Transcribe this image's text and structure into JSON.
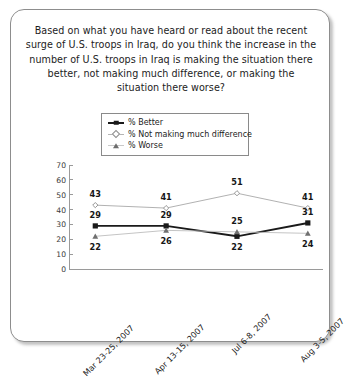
{
  "card": {
    "question": "Based on what you have heard or read about the recent surge of U.S. troops in Iraq, do you think the increase in the number of U.S. troops in Iraq is making the situation there better, not making much difference, or making the situation there worse?"
  },
  "legend": {
    "position": "top-center",
    "items": [
      {
        "label": "% Better",
        "marker": "square-marker",
        "color": "#1a1a1a"
      },
      {
        "label": "% Not making much difference",
        "marker": "diamond-marker",
        "color": "#8c8c8c"
      },
      {
        "label": "% Worse",
        "marker": "triangle-marker",
        "color": "#6d6d6d"
      }
    ]
  },
  "chart_data": {
    "type": "line",
    "title": "",
    "xlabel": "",
    "ylabel": "",
    "ylim": [
      0,
      70
    ],
    "yticks": [
      0,
      10,
      20,
      30,
      40,
      50,
      60,
      70
    ],
    "grid": false,
    "legend_position": "top-center",
    "categories": [
      "Mar 23-25, 2007",
      "Apr 13-15, 2007",
      "Jul 6-8, 2007",
      "Aug 3-5, 2007"
    ],
    "series": [
      {
        "name": "% Better",
        "values": [
          29,
          29,
          22,
          31
        ],
        "marker": "square",
        "color": "#1a1a1a"
      },
      {
        "name": "% Not making much difference",
        "values": [
          43,
          41,
          51,
          41
        ],
        "marker": "diamond",
        "color": "#9c9c9c"
      },
      {
        "name": "% Worse",
        "values": [
          22,
          26,
          25,
          24
        ],
        "marker": "triangle",
        "color": "#b0b0b0"
      }
    ],
    "point_labels": [
      {
        "series": "% Not making much difference",
        "index": 0,
        "text": "43"
      },
      {
        "series": "% Not making much difference",
        "index": 1,
        "text": "41"
      },
      {
        "series": "% Not making much difference",
        "index": 2,
        "text": "51"
      },
      {
        "series": "% Not making much difference",
        "index": 3,
        "text": "41"
      },
      {
        "series": "% Better",
        "index": 0,
        "text": "29"
      },
      {
        "series": "% Better",
        "index": 1,
        "text": "29"
      },
      {
        "series": "% Better",
        "index": 2,
        "text": "22"
      },
      {
        "series": "% Better",
        "index": 3,
        "text": "31"
      },
      {
        "series": "% Worse",
        "index": 0,
        "text": "22"
      },
      {
        "series": "% Worse",
        "index": 1,
        "text": "26"
      },
      {
        "series": "% Worse",
        "index": 2,
        "text": "25"
      },
      {
        "series": "% Worse",
        "index": 3,
        "text": "24"
      }
    ]
  }
}
